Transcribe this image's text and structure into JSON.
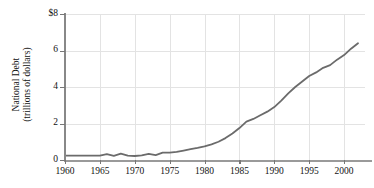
{
  "chart_data": {
    "type": "line",
    "title": "",
    "subtitle": "",
    "xlabel": "",
    "ylabel": "National Debt (trillions of dollars)",
    "ylabel_line1": "National Debt",
    "ylabel_line2": "(trillions of dollars)",
    "grid": true,
    "legend": "none",
    "xlim": [
      1960,
      2003
    ],
    "ylim": [
      0,
      8
    ],
    "xticks": [
      1960,
      1965,
      1970,
      1975,
      1980,
      1985,
      1990,
      1995,
      2000
    ],
    "xticklabels": [
      "1960",
      "1965",
      "1970",
      "1975",
      "1980",
      "1985",
      "1990",
      "1995",
      "2000"
    ],
    "yticks": [
      0,
      2,
      4,
      6,
      8
    ],
    "yticklabels": [
      "0",
      "2",
      "4",
      "6",
      "$8"
    ],
    "series": [
      {
        "name": "National Debt",
        "color": "#6b6b6b",
        "x": [
          1960,
          1961,
          1962,
          1963,
          1964,
          1965,
          1966,
          1967,
          1968,
          1969,
          1970,
          1971,
          1972,
          1973,
          1974,
          1975,
          1976,
          1977,
          1978,
          1979,
          1980,
          1981,
          1982,
          1983,
          1984,
          1985,
          1986,
          1987,
          1988,
          1989,
          1990,
          1991,
          1992,
          1993,
          1994,
          1995,
          1996,
          1997,
          1998,
          1999,
          2000,
          2001,
          2002
        ],
        "values": [
          0.24,
          0.24,
          0.24,
          0.24,
          0.24,
          0.24,
          0.32,
          0.23,
          0.35,
          0.24,
          0.22,
          0.25,
          0.34,
          0.27,
          0.4,
          0.4,
          0.44,
          0.52,
          0.6,
          0.67,
          0.75,
          0.86,
          1.0,
          1.2,
          1.45,
          1.75,
          2.1,
          2.25,
          2.45,
          2.65,
          2.9,
          3.25,
          3.65,
          4.0,
          4.3,
          4.6,
          4.8,
          5.05,
          5.2,
          5.5,
          5.75,
          6.1,
          6.4
        ]
      }
    ]
  }
}
